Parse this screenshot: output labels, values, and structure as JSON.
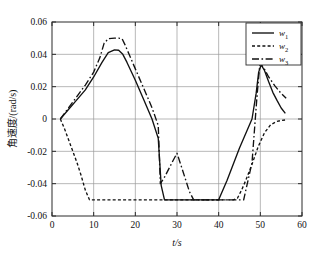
{
  "chart_data": {
    "type": "line",
    "title": "",
    "xlabel": "t/s",
    "ylabel": "角速度/(rad/s)",
    "xlim": [
      0,
      60
    ],
    "ylim": [
      -0.06,
      0.06
    ],
    "xticks": [
      0,
      10,
      20,
      30,
      40,
      50,
      60
    ],
    "xticklabels": [
      "0",
      "10",
      "20",
      "30",
      "40",
      "50",
      "60"
    ],
    "yticks": [
      -0.06,
      -0.04,
      -0.02,
      0,
      0.02,
      0.04,
      0.06
    ],
    "yticklabels": [
      "-0.06",
      "-0.04",
      "-0.02",
      "0",
      "0.02",
      "0.04",
      "0.06"
    ],
    "grid": true,
    "legend_position": "top-right",
    "legend": [
      {
        "name": "w",
        "sub": "1",
        "style": "solid"
      },
      {
        "name": "w",
        "sub": "2",
        "style": "dotted"
      },
      {
        "name": "w",
        "sub": "3",
        "style": "dashdot"
      }
    ],
    "series": [
      {
        "name": "w1",
        "label": "w₁",
        "style": "solid",
        "x": [
          2.0,
          4.0,
          6.0,
          8.0,
          10.0,
          12.0,
          13.5,
          15.0,
          16.0,
          17.0,
          18.0,
          20.0,
          22.0,
          24.0,
          25.5,
          26.2,
          27.0,
          28.0,
          30.0,
          40.0,
          42.0,
          45.0,
          48.0,
          49.0,
          49.6,
          50.2,
          51.0,
          52.0,
          53.0,
          54.0,
          55.0,
          56.0
        ],
        "y": [
          0.0,
          0.006,
          0.012,
          0.018,
          0.026,
          0.035,
          0.041,
          0.0428,
          0.0425,
          0.04,
          0.035,
          0.024,
          0.012,
          0.0,
          -0.012,
          -0.041,
          -0.05,
          -0.05,
          -0.05,
          -0.05,
          -0.038,
          -0.018,
          0.0,
          0.016,
          0.029,
          0.0335,
          0.03,
          0.023,
          0.0165,
          0.0115,
          0.0068,
          0.0035
        ]
      },
      {
        "name": "w2",
        "label": "w₂",
        "style": "dotted",
        "x": [
          2.0,
          3.0,
          4.0,
          5.0,
          6.0,
          7.0,
          8.0,
          9.0,
          12.0,
          16.0,
          20.0,
          24.0,
          28.0,
          32.0,
          36.0,
          40.0,
          42.0,
          43.5,
          44.5,
          45.5,
          46.5,
          48.0,
          49.5,
          51.0,
          52.5,
          54.0,
          55.0,
          56.0
        ],
        "y": [
          0.0,
          -0.006,
          -0.013,
          -0.02,
          -0.027,
          -0.035,
          -0.044,
          -0.05,
          -0.05,
          -0.05,
          -0.05,
          -0.05,
          -0.05,
          -0.05,
          -0.05,
          -0.05,
          -0.05,
          -0.05,
          -0.049,
          -0.044,
          -0.038,
          -0.028,
          -0.017,
          -0.0085,
          -0.0035,
          -0.0015,
          -0.0009,
          -0.0006
        ]
      },
      {
        "name": "w3",
        "label": "w₃",
        "style": "dashdot",
        "x": [
          2.0,
          4.0,
          6.0,
          8.0,
          10.0,
          11.5,
          12.5,
          13.5,
          15.0,
          16.0,
          16.8,
          17.5,
          18.5,
          20.0,
          22.0,
          24.0,
          25.5,
          26.0,
          27.0,
          28.0,
          29.0,
          30.0,
          31.0,
          32.0,
          33.0,
          34.0,
          36.0,
          40.0,
          43.0,
          46.0,
          48.0,
          49.2,
          49.9,
          50.8,
          52.0,
          53.5,
          55.0,
          56.2
        ],
        "y": [
          0.0,
          0.007,
          0.014,
          0.021,
          0.029,
          0.038,
          0.0468,
          0.0497,
          0.05,
          0.05,
          0.0498,
          0.046,
          0.04,
          0.031,
          0.019,
          0.007,
          -0.004,
          -0.04,
          -0.036,
          -0.031,
          -0.026,
          -0.0212,
          -0.029,
          -0.037,
          -0.045,
          -0.05,
          -0.05,
          -0.05,
          -0.05,
          -0.05,
          -0.027,
          0.014,
          0.0345,
          0.0318,
          0.026,
          0.0205,
          0.0158,
          0.0128
        ]
      }
    ]
  },
  "axes": {
    "left_px": 52,
    "right_px": 302,
    "top_px": 22,
    "bottom_px": 216
  }
}
